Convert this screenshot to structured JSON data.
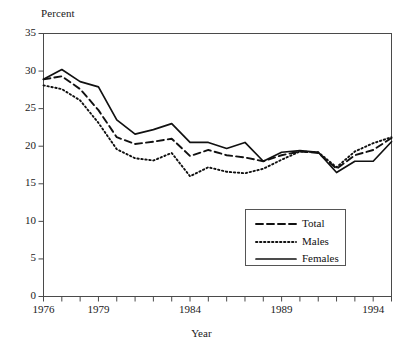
{
  "chart_data": {
    "type": "line",
    "title": "",
    "xlabel": "Year",
    "ylabel": "Percent",
    "ylim": [
      0,
      35
    ],
    "xlim": [
      1976,
      1995
    ],
    "yticks": [
      0,
      5,
      10,
      15,
      20,
      25,
      30,
      35
    ],
    "xticks_labeled": [
      1976,
      1979,
      1984,
      1989,
      1994
    ],
    "xticks_all": [
      1976,
      1977,
      1978,
      1979,
      1980,
      1981,
      1982,
      1983,
      1984,
      1985,
      1986,
      1987,
      1988,
      1989,
      1990,
      1991,
      1992,
      1993,
      1994,
      1995
    ],
    "grid": false,
    "legend_position": "lower-right",
    "x": [
      1976,
      1977,
      1978,
      1979,
      1980,
      1981,
      1982,
      1983,
      1984,
      1985,
      1986,
      1987,
      1988,
      1989,
      1990,
      1991,
      1992,
      1993,
      1994,
      1995
    ],
    "series": [
      {
        "name": "Total",
        "style": "dashed",
        "values": [
          28.9,
          29.3,
          27.6,
          24.8,
          21.2,
          20.3,
          20.6,
          21.0,
          18.7,
          19.5,
          18.8,
          18.5,
          18.0,
          18.8,
          19.3,
          19.1,
          17.0,
          18.8,
          19.5,
          21.1
        ]
      },
      {
        "name": "Males",
        "style": "dotted",
        "values": [
          28.1,
          27.6,
          26.1,
          23.1,
          19.6,
          18.4,
          18.1,
          19.1,
          16.0,
          17.2,
          16.6,
          16.4,
          17.0,
          18.2,
          19.3,
          19.2,
          17.2,
          19.3,
          20.4,
          21.2
        ]
      },
      {
        "name": "Females",
        "style": "solid",
        "values": [
          28.9,
          30.2,
          28.6,
          27.9,
          23.5,
          21.6,
          22.2,
          23.0,
          20.5,
          20.5,
          19.7,
          20.5,
          18.0,
          19.2,
          19.4,
          19.2,
          16.5,
          18.0,
          18.0,
          20.6
        ]
      }
    ]
  },
  "legend": {
    "items": [
      {
        "label": "Total",
        "style": "dashed"
      },
      {
        "label": "Males",
        "style": "dotted"
      },
      {
        "label": "Females",
        "style": "solid"
      }
    ]
  },
  "axes": {
    "y_label": "Percent",
    "x_label": "Year",
    "y_tick_labels": [
      "35",
      "30",
      "25",
      "20",
      "15",
      "10",
      "5",
      "0"
    ],
    "x_tick_labels": [
      "1976",
      "1979",
      "1984",
      "1989",
      "1994"
    ]
  },
  "colors": {
    "line": "#111111",
    "frame": "#4a4a4a",
    "background": "#ffffff"
  }
}
